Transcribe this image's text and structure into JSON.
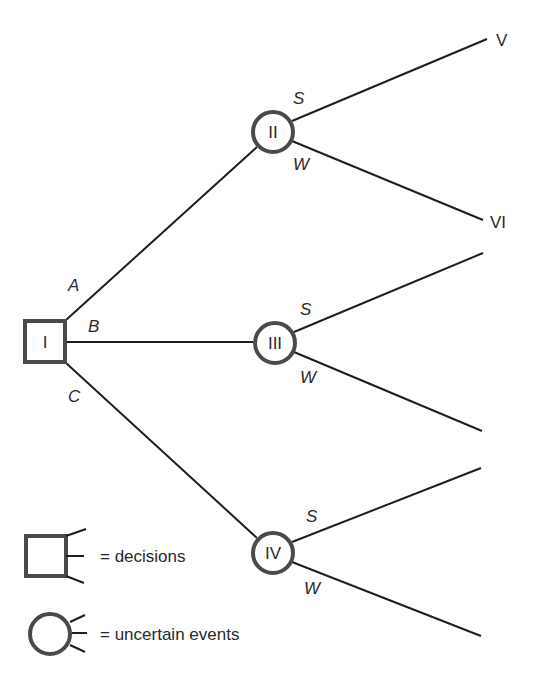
{
  "diagram": {
    "type": "decision-tree",
    "nodes": {
      "decision": {
        "label": "I"
      },
      "event_2": {
        "label": "II"
      },
      "event_3": {
        "label": "III"
      },
      "event_4": {
        "label": "IV"
      },
      "outcome_5": {
        "label": "V"
      },
      "outcome_6": {
        "label": "VI"
      }
    },
    "branches": {
      "a": "A",
      "b": "B",
      "c": "C",
      "s2": "S",
      "w2": "W",
      "s3": "S",
      "w3": "W",
      "s4": "S",
      "w4": "W"
    },
    "legend": {
      "decisions": "= decisions",
      "uncertain_events": "= uncertain events"
    }
  }
}
